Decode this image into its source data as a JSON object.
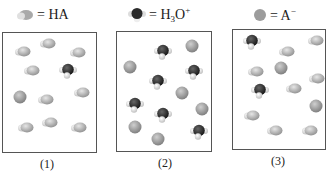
{
  "legend": [
    {
      "species": "HA",
      "label": "= HA",
      "glyph": "ha-molecule"
    },
    {
      "species": "H3O+",
      "label_prefix": "= H",
      "sub": "3",
      "label_mid": "O",
      "sup": "+",
      "glyph": "hydronium-molecule"
    },
    {
      "species": "A-",
      "label_prefix": "= A",
      "sup": "−",
      "glyph": "anion-sphere"
    }
  ],
  "colors": {
    "ha_body": "#a8a8a8",
    "ha_h": "#e8e8e8",
    "h3o_o": "#2a2a2a",
    "h3o_h": "#eeeeee",
    "anion": "#9a9a9a",
    "border": "#555555"
  },
  "panels": [
    {
      "label": "(1)",
      "counts": {
        "HA": 11,
        "H3O+": 1,
        "A-": 1
      }
    },
    {
      "label": "(2)",
      "counts": {
        "HA": 0,
        "H3O+": 6,
        "A-": 6
      }
    },
    {
      "label": "(3)",
      "counts": {
        "HA": 9,
        "H3O+": 2,
        "A-": 2
      }
    }
  ]
}
